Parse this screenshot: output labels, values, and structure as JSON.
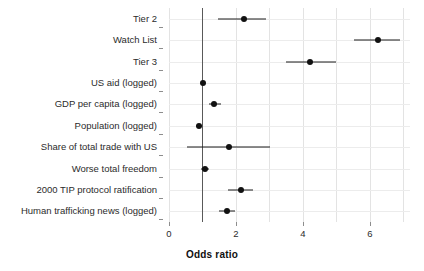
{
  "chart_data": {
    "type": "scatter",
    "subtype": "forest-plot",
    "title": "",
    "xlabel": "Odds ratio",
    "ylabel": "",
    "xlim": [
      0,
      7.2
    ],
    "xticks": [
      0,
      2,
      4,
      6
    ],
    "xtick_labels": [
      "0",
      "2",
      "4",
      "6"
    ],
    "grid": true,
    "legend": "none",
    "reference_line": 1,
    "categories": [
      "Tier 2",
      "Watch List",
      "Tier 3",
      "US aid (logged)",
      "GDP per capita (logged)",
      "Population (logged)",
      "Share of total trade with US",
      "Worse total freedom",
      "2000 TIP protocol ratification",
      "Human trafficking news (logged)"
    ],
    "values": [
      2.25,
      6.25,
      4.21,
      1.01,
      1.34,
      0.9,
      1.79,
      1.07,
      2.15,
      1.73
    ],
    "ci_low": [
      1.47,
      5.53,
      3.49,
      0.96,
      1.19,
      0.82,
      0.54,
      0.95,
      1.75,
      1.5
    ],
    "ci_high": [
      2.9,
      6.9,
      4.99,
      1.07,
      1.55,
      1.0,
      3.01,
      1.2,
      2.52,
      1.96
    ],
    "points": [
      {
        "label": "Tier 2",
        "or": 2.25,
        "low": 1.47,
        "high": 2.9
      },
      {
        "label": "Watch List",
        "or": 6.25,
        "low": 5.53,
        "high": 6.9
      },
      {
        "label": "Tier 3",
        "or": 4.21,
        "low": 3.49,
        "high": 4.99
      },
      {
        "label": "US aid (logged)",
        "or": 1.01,
        "low": 0.96,
        "high": 1.07
      },
      {
        "label": "GDP per capita (logged)",
        "or": 1.34,
        "low": 1.19,
        "high": 1.55
      },
      {
        "label": "Population (logged)",
        "or": 0.9,
        "low": 0.82,
        "high": 1.0
      },
      {
        "label": "Share of total trade with US",
        "or": 1.79,
        "low": 0.54,
        "high": 3.01
      },
      {
        "label": "Worse total freedom",
        "or": 1.07,
        "low": 0.95,
        "high": 1.2
      },
      {
        "label": "2000 TIP protocol ratification",
        "or": 2.15,
        "low": 1.75,
        "high": 2.52
      },
      {
        "label": "Human trafficking news (logged)",
        "or": 1.73,
        "low": 1.5,
        "high": 1.96
      }
    ],
    "colors": {
      "point": "#111111",
      "ci": "#1b1b1b",
      "reference_line": "#595959",
      "grid": "#e3e3e3",
      "background": "#ffffff",
      "text": "#2b2b2b"
    }
  }
}
